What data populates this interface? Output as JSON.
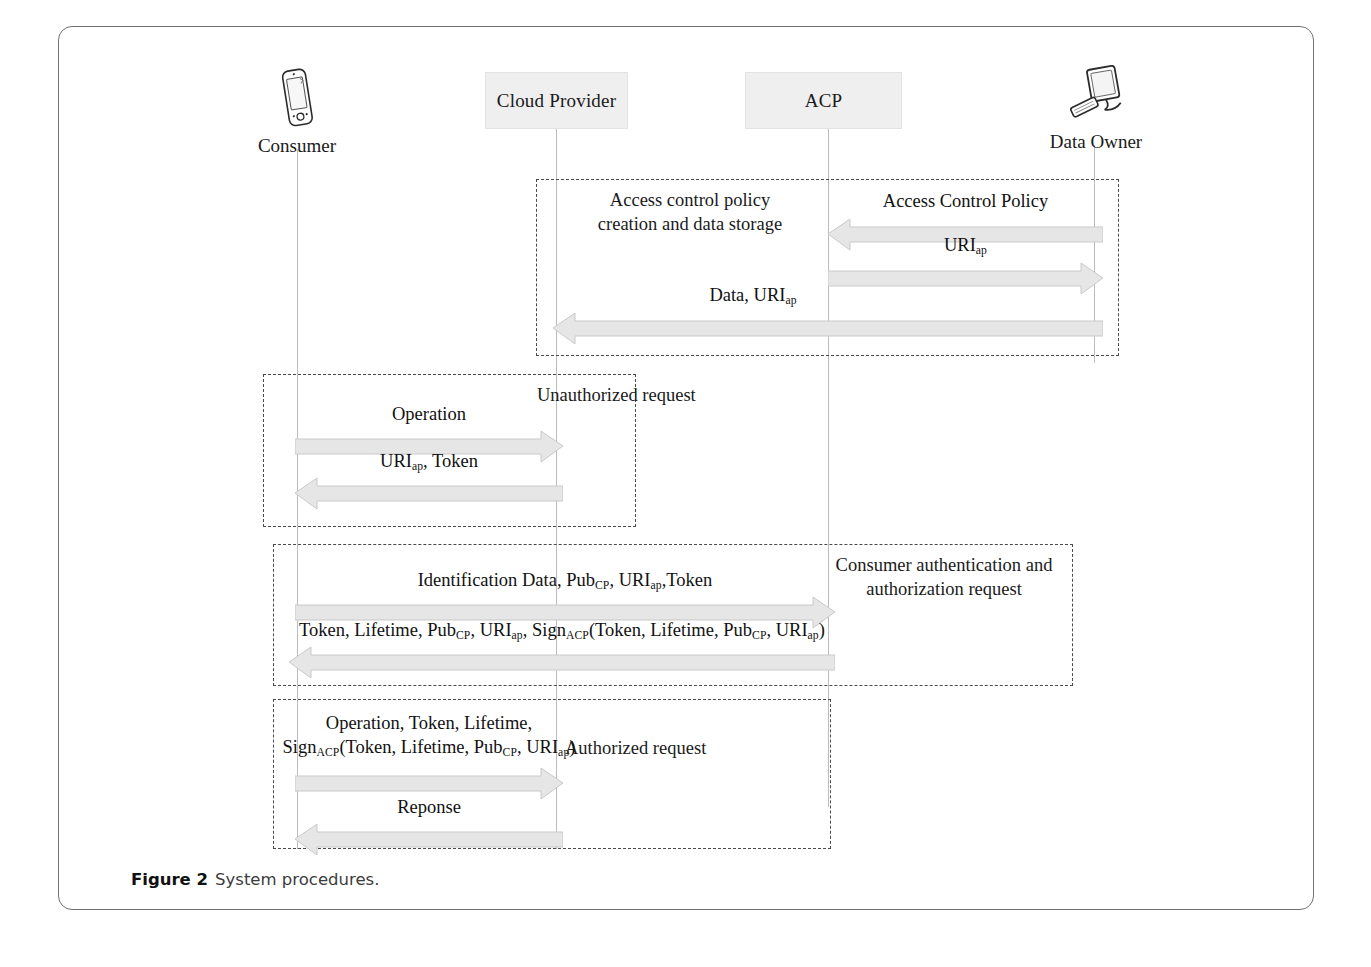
{
  "figure": {
    "caption_label": "Figure 2",
    "caption_text": "System procedures.",
    "colors": {
      "participant_fill": "#efefef",
      "arrow_fill": "#e6e6e6",
      "arrow_stroke": "#c9c9c9",
      "frame_stroke": "#4a4a4a",
      "lifeline_stroke": "#b9bcc0",
      "card_border": "#6e7276",
      "text": "#1a1a1a"
    }
  },
  "participants": [
    {
      "id": "consumer",
      "label": "Consumer",
      "kind": "icon",
      "icon": "smartphone-icon",
      "x": 296
    },
    {
      "id": "cloud-provider",
      "label": "Cloud Provider",
      "kind": "box",
      "icon": "",
      "x": 555
    },
    {
      "id": "acp",
      "label": "ACP",
      "kind": "box",
      "icon": "",
      "x": 827
    },
    {
      "id": "data-owner",
      "label": "Data Owner",
      "kind": "icon",
      "icon": "desktop-computer-icon",
      "x": 1093
    }
  ],
  "fragments": [
    {
      "id": "policy-creation",
      "note": "Access control policy\ncreation and data storage",
      "note_align": "left"
    },
    {
      "id": "unauthorized-request",
      "note": "Unauthorized request",
      "note_align": "right"
    },
    {
      "id": "consumer-authentication",
      "note": "Consumer authentication and\nauthorization request",
      "note_align": "right"
    },
    {
      "id": "authorized-request",
      "note": "Authorized request",
      "note_align": "right"
    }
  ],
  "messages": [
    {
      "id": "access-control-policy",
      "label": "Access Control Policy",
      "from": "data-owner",
      "to": "acp",
      "direction": "left"
    },
    {
      "id": "uri-ap-to-owner",
      "label": "URI<sub>ap</sub>",
      "from": "acp",
      "to": "data-owner",
      "direction": "right"
    },
    {
      "id": "data-uri-ap",
      "label": "Data, URI<sub>ap</sub>",
      "from": "data-owner",
      "to": "cloud-provider",
      "direction": "left"
    },
    {
      "id": "operation",
      "label": "Operation",
      "from": "consumer",
      "to": "cloud-provider",
      "direction": "right"
    },
    {
      "id": "uri-ap-token",
      "label": "URI<sub>ap</sub>, Token",
      "from": "cloud-provider",
      "to": "consumer",
      "direction": "left"
    },
    {
      "id": "identification-data",
      "label": "Identification Data, Pub<sub>CP</sub>, URI<sub>ap</sub>,Token",
      "from": "consumer",
      "to": "acp",
      "direction": "right"
    },
    {
      "id": "token-lifetime-sign",
      "label": "Token, Lifetime, Pub<sub>CP</sub>, URI<sub>ap</sub>, Sign<sub>ACP</sub>(Token, Lifetime, Pub<sub>CP</sub>, URI<sub>ap</sub>)",
      "from": "acp",
      "to": "consumer",
      "direction": "left"
    },
    {
      "id": "authorized-operation",
      "label": "Operation, Token, Lifetime,\nSign<sub>ACP</sub>(Token, Lifetime, Pub<sub>CP</sub>, URI<sub>ap</sub>)",
      "from": "consumer",
      "to": "cloud-provider",
      "direction": "right"
    },
    {
      "id": "reponse",
      "label": "Reponse",
      "from": "cloud-provider",
      "to": "consumer",
      "direction": "left"
    }
  ]
}
